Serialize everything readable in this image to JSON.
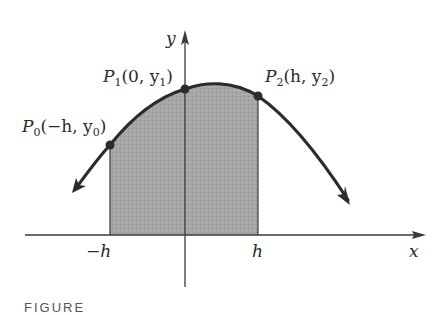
{
  "figure": {
    "axes": {
      "x_label": "x",
      "y_label": "y",
      "x_ticks": [
        "−h",
        "h"
      ]
    },
    "points": [
      {
        "name": "P",
        "sub": "0",
        "coords_pre": "(−h, y",
        "coords_sub": "0",
        "coords_post": ")"
      },
      {
        "name": "P",
        "sub": "1",
        "coords_pre": "(0, y",
        "coords_sub": "1",
        "coords_post": ")"
      },
      {
        "name": "P",
        "sub": "2",
        "coords_pre": "(h, y",
        "coords_sub": "2",
        "coords_post": ")"
      }
    ],
    "caption": "FIGURE",
    "colors": {
      "curve": "#2b2b2b",
      "shade": "#a9a9a9",
      "axis": "#3a3a3a"
    }
  }
}
